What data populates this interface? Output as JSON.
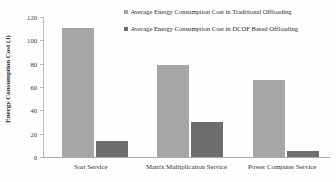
{
  "chart_data": {
    "type": "bar",
    "title": "",
    "xlabel": "",
    "ylabel": "Energy Consumption Cost (J)",
    "ylim": [
      0,
      120
    ],
    "ytick_values": [
      0,
      20,
      40,
      60,
      80,
      100,
      120
    ],
    "ytick_labels": [
      "0",
      "20",
      "40",
      "60",
      "80",
      "100",
      "120"
    ],
    "grid": false,
    "legend_position": "top-right",
    "categories": [
      "Sort Service",
      "Matrix Multiplication Service",
      "Power Computer Service"
    ],
    "series": [
      {
        "name": "Average Energy Consumption Cost in Traditional Offloading",
        "color": "#a6a6a6",
        "values": [
          111,
          79,
          66
        ]
      },
      {
        "name": "Average Energy Consumption Cost in DCOF Based Offloading",
        "color": "#6d6d6d",
        "values": [
          14,
          30,
          5
        ]
      }
    ]
  },
  "legend": {
    "entries": [
      {
        "label": "Average Energy Consumption Cost in Traditional Offloading",
        "color": "#a6a6a6"
      },
      {
        "label": "Average Energy Consumption Cost in DCOF Based Offloading",
        "color": "#6d6d6d"
      }
    ]
  }
}
